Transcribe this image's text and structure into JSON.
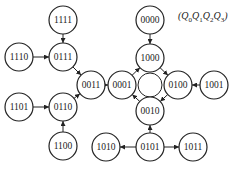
{
  "legend": {
    "label": "(Q0Q1Q2Q3)",
    "parts": [
      "Q",
      "0",
      "Q",
      "1",
      "Q",
      "2",
      "Q",
      "3"
    ]
  },
  "nodes": [
    {
      "id": "1111",
      "x": 63,
      "y": 20
    },
    {
      "id": "1110",
      "x": 19,
      "y": 57
    },
    {
      "id": "0111",
      "x": 63,
      "y": 57
    },
    {
      "id": "0011",
      "x": 91,
      "y": 85
    },
    {
      "id": "1101",
      "x": 19,
      "y": 107
    },
    {
      "id": "0110",
      "x": 63,
      "y": 107
    },
    {
      "id": "1100",
      "x": 63,
      "y": 146
    },
    {
      "id": "0000",
      "x": 150,
      "y": 20
    },
    {
      "id": "1000",
      "x": 150,
      "y": 58
    },
    {
      "id": "0001",
      "x": 122,
      "y": 85
    },
    {
      "id": "0100",
      "x": 178,
      "y": 85
    },
    {
      "id": "1001",
      "x": 214,
      "y": 85
    },
    {
      "id": "0010",
      "x": 150,
      "y": 111
    },
    {
      "id": "1010",
      "x": 106,
      "y": 147
    },
    {
      "id": "0101",
      "x": 150,
      "y": 147
    },
    {
      "id": "1011",
      "x": 193,
      "y": 147
    }
  ],
  "edges": [
    {
      "from": "1111",
      "to": "0111"
    },
    {
      "from": "1110",
      "to": "0111"
    },
    {
      "from": "0111",
      "to": "0011"
    },
    {
      "from": "1101",
      "to": "0110"
    },
    {
      "from": "1100",
      "to": "0110"
    },
    {
      "from": "0110",
      "to": "0011"
    },
    {
      "from": "0011",
      "to": "0001"
    },
    {
      "from": "0000",
      "to": "1000"
    },
    {
      "from": "1000",
      "to": "0100"
    },
    {
      "from": "0100",
      "to": "0010"
    },
    {
      "from": "0010",
      "to": "0001"
    },
    {
      "from": "0001",
      "to": "1000"
    },
    {
      "from": "1001",
      "to": "0100"
    },
    {
      "from": "0101",
      "to": "0010"
    },
    {
      "from": "0101",
      "to": "1010"
    },
    {
      "from": "0101",
      "to": "1011"
    }
  ],
  "cycle": {
    "cx": 150,
    "cy": 85,
    "r": 12
  }
}
